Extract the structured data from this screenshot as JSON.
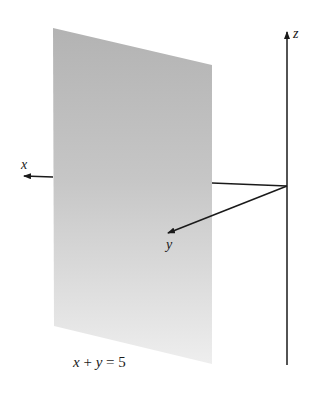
{
  "figure": {
    "width": 311,
    "height": 395,
    "background": "#ffffff",
    "plane": {
      "equation_parts": {
        "x": "x",
        "plus": " + ",
        "y": "y",
        "equals": " = ",
        "constant": "5"
      },
      "equation_label": "x + y = 5",
      "color_top": "#b4b4b4",
      "color_bottom": "#ececec"
    },
    "axes": {
      "x": {
        "label": "x"
      },
      "y": {
        "label": "y"
      },
      "z": {
        "label": "z"
      },
      "color": "#1a1a1a"
    }
  }
}
